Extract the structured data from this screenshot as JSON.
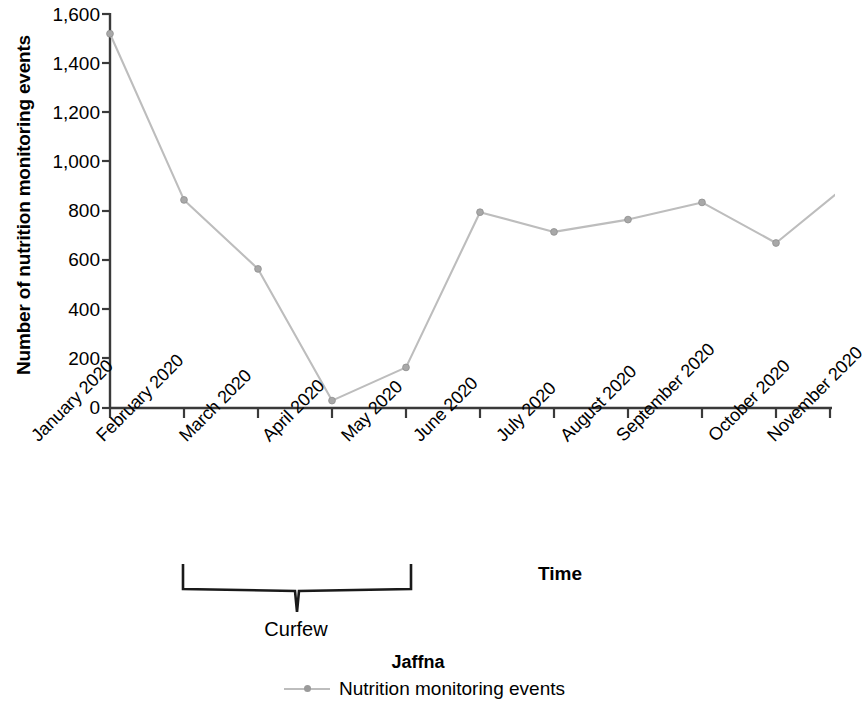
{
  "chart_data": {
    "type": "line",
    "title": "Jaffna",
    "xlabel": "Time",
    "ylabel": "Number of nutrition monitoring events",
    "categories": [
      "January 2020",
      "February 2020",
      "March 2020",
      "April 2020",
      "May 2020",
      "June 2020",
      "July 2020",
      "August 2020",
      "September 2020",
      "October 2020",
      "November 2020"
    ],
    "series": [
      {
        "name": "Nutrition monitoring events",
        "values": [
          1520,
          845,
          565,
          30,
          165,
          795,
          715,
          765,
          835,
          670,
          915
        ],
        "color": "#bdbdbd",
        "marker_color": "#a8a8a8"
      }
    ],
    "ylim": [
      0,
      1600
    ],
    "y_ticks": [
      0,
      200,
      400,
      600,
      800,
      1000,
      1200,
      1400,
      1600
    ],
    "y_tick_labels": [
      "0",
      "200",
      "400",
      "600",
      "800",
      "1,000",
      "1,200",
      "1,400",
      "1,600"
    ],
    "grid": false,
    "legend_position": "bottom",
    "annotations": [
      {
        "label": "Curfew",
        "type": "bracket",
        "span_start": "March 2020",
        "span_end": "May 2020"
      }
    ]
  },
  "legend": {
    "series_label": "Nutrition monitoring events"
  }
}
